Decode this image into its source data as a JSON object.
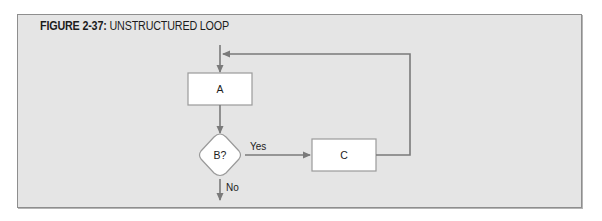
{
  "figure": {
    "number_label": "FIGURE 2-37:",
    "title": "UNSTRUCTURED LOOP"
  },
  "diagram": {
    "nodes": [
      {
        "id": "A",
        "type": "process",
        "label": "A"
      },
      {
        "id": "B",
        "type": "decision",
        "label": "B?"
      },
      {
        "id": "C",
        "type": "process",
        "label": "C"
      }
    ],
    "edges": [
      {
        "from": "start",
        "to": "A",
        "label": ""
      },
      {
        "from": "A",
        "to": "B",
        "label": ""
      },
      {
        "from": "B",
        "to": "C",
        "label": "Yes"
      },
      {
        "from": "C",
        "to": "A",
        "label": "",
        "note": "loops back above A"
      },
      {
        "from": "B",
        "to": "exit",
        "label": "No"
      }
    ],
    "colors": {
      "panel": "#e5e5e5",
      "line": "#7a7a7a",
      "box_fill": "#ffffff"
    }
  },
  "labels": {
    "node_a": "A",
    "node_b": "B?",
    "node_c": "C",
    "yes": "Yes",
    "no": "No"
  }
}
